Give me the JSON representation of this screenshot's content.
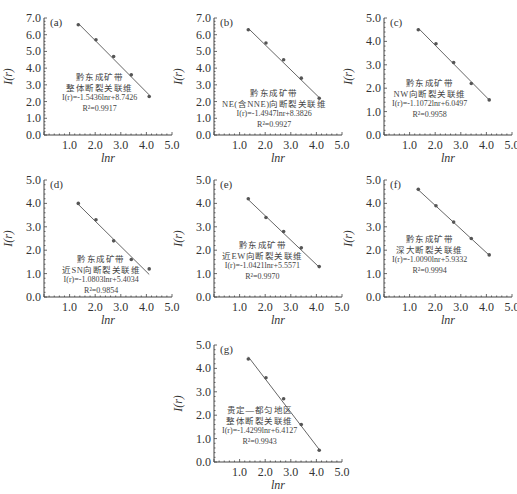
{
  "figure": {
    "xlabel": "lnr",
    "ylabel": "I(r)",
    "x_ticks": [
      "1.0",
      "2.0",
      "3.0",
      "4.0",
      "5.0"
    ]
  },
  "chart_data": [
    {
      "type": "scatter",
      "panel": "(a)",
      "title_line1": "黔东成矿带",
      "title_line2": "整体断裂关联维",
      "equation": "I(r)=-1.5436lnr+8.7426",
      "r2": "R²=0.9917",
      "slope": -1.5436,
      "intercept": 8.7426,
      "x": [
        1.34,
        2.03,
        2.72,
        3.41,
        4.11
      ],
      "y": [
        6.6,
        5.7,
        4.7,
        3.6,
        2.3
      ],
      "y_note": "y values estimated from pixel positions, approx ±0.1",
      "xlabel": "lnr",
      "ylabel": "I(r)",
      "xlim": [
        0,
        5
      ],
      "ylim": [
        0,
        7
      ],
      "y_ticks": [
        "0.0",
        "1.0",
        "2.0",
        "3.0",
        "4.0",
        "5.0",
        "6.0",
        "7.0"
      ]
    },
    {
      "type": "scatter",
      "panel": "(b)",
      "title_line1": "黔东成矿带",
      "title_line2": "NE(含NNE)向断裂关联维",
      "equation": "I(r)=-1.4947lnr+8.3826",
      "r2": "R²=0.9927",
      "slope": -1.4947,
      "intercept": 8.3826,
      "x": [
        1.34,
        2.03,
        2.72,
        3.41,
        4.11
      ],
      "y": [
        6.3,
        5.5,
        4.5,
        3.4,
        2.2
      ],
      "y_note": "y values estimated from pixel positions, approx ±0.1",
      "xlabel": "lnr",
      "ylabel": "I(r)",
      "xlim": [
        0,
        5
      ],
      "ylim": [
        0,
        7
      ],
      "y_ticks": [
        "0.0",
        "1.0",
        "2.0",
        "3.0",
        "4.0",
        "5.0",
        "6.0",
        "7.0"
      ]
    },
    {
      "type": "scatter",
      "panel": "(c)",
      "title_line1": "黔东成矿带",
      "title_line2": "NW向断裂关联维",
      "equation": "I(r)=-1.1072lnr+6.0497",
      "r2": "R²=0.9958",
      "slope": -1.1072,
      "intercept": 6.0497,
      "x": [
        1.34,
        2.03,
        2.72,
        3.41,
        4.11
      ],
      "y": [
        4.5,
        3.9,
        3.1,
        2.2,
        1.5
      ],
      "y_note": "y values estimated from pixel positions, approx ±0.1",
      "xlabel": "lnr",
      "ylabel": "I(r)",
      "xlim": [
        0,
        5
      ],
      "ylim": [
        0,
        5
      ],
      "y_ticks": [
        "0.0",
        "1.0",
        "2.0",
        "3.0",
        "4.0",
        "5.0"
      ]
    },
    {
      "type": "scatter",
      "panel": "(d)",
      "title_line1": "黔东成矿带",
      "title_line2": "近SN向断裂关联维",
      "equation": "I(r)=-1.0803lnr+5.4034",
      "r2": "R²=0.9854",
      "slope": -1.0803,
      "intercept": 5.4034,
      "x": [
        1.34,
        2.03,
        2.72,
        3.41,
        4.11
      ],
      "y": [
        4.0,
        3.3,
        2.4,
        1.6,
        1.2
      ],
      "y_note": "y values estimated from pixel positions, approx ±0.1",
      "xlabel": "lnr",
      "ylabel": "I(r)",
      "xlim": [
        0,
        5
      ],
      "ylim": [
        0,
        5
      ],
      "y_ticks": [
        "0.0",
        "1.0",
        "2.0",
        "3.0",
        "4.0",
        "5.0"
      ]
    },
    {
      "type": "scatter",
      "panel": "(e)",
      "title_line1": "黔东成矿带",
      "title_line2": "近EW向断裂关联维",
      "equation": "I(r)=-1.0421lnr+5.5571",
      "r2": "R²=0.9970",
      "slope": -1.0421,
      "intercept": 5.5571,
      "x": [
        1.34,
        2.03,
        2.72,
        3.41,
        4.11
      ],
      "y": [
        4.2,
        3.4,
        2.8,
        2.1,
        1.3
      ],
      "y_note": "y values estimated from pixel positions, approx ±0.1",
      "xlabel": "lnr",
      "ylabel": "I(r)",
      "xlim": [
        0,
        5
      ],
      "ylim": [
        0,
        5
      ],
      "y_ticks": [
        "0.0",
        "1.0",
        "2.0",
        "3.0",
        "4.0",
        "5.0"
      ]
    },
    {
      "type": "scatter",
      "panel": "(f)",
      "title_line1": "黔东成矿带",
      "title_line2": "深大断裂关联维",
      "equation": "I(r)=-1.0090lnr+5.9332",
      "r2": "R²=0.9994",
      "slope": -1.009,
      "intercept": 5.9332,
      "x": [
        1.34,
        2.03,
        2.72,
        3.41,
        4.11
      ],
      "y": [
        4.6,
        3.9,
        3.2,
        2.5,
        1.8
      ],
      "y_note": "y values estimated from pixel positions, approx ±0.1",
      "xlabel": "lnr",
      "ylabel": "I(r)",
      "xlim": [
        0,
        5
      ],
      "ylim": [
        0,
        5
      ],
      "y_ticks": [
        "0.0",
        "1.0",
        "2.0",
        "3.0",
        "4.0",
        "5.0"
      ]
    },
    {
      "type": "scatter",
      "panel": "(g)",
      "title_line1": "贵定—都匀地区",
      "title_line2": "整体断裂关联维",
      "equation": "I(r)=-1.4299lnr+6.4127",
      "r2": "R²=0.9943",
      "slope": -1.4299,
      "intercept": 6.4127,
      "x": [
        1.34,
        2.03,
        2.72,
        3.41,
        4.11
      ],
      "y": [
        4.4,
        3.6,
        2.7,
        1.6,
        0.5
      ],
      "y_note": "y values estimated from pixel positions, approx ±0.1",
      "xlabel": "lnr",
      "ylabel": "I(r)",
      "xlim": [
        0,
        5
      ],
      "ylim": [
        0,
        5
      ],
      "y_ticks": [
        "0.0",
        "1.0",
        "2.0",
        "3.0",
        "4.0",
        "5.0"
      ]
    }
  ]
}
